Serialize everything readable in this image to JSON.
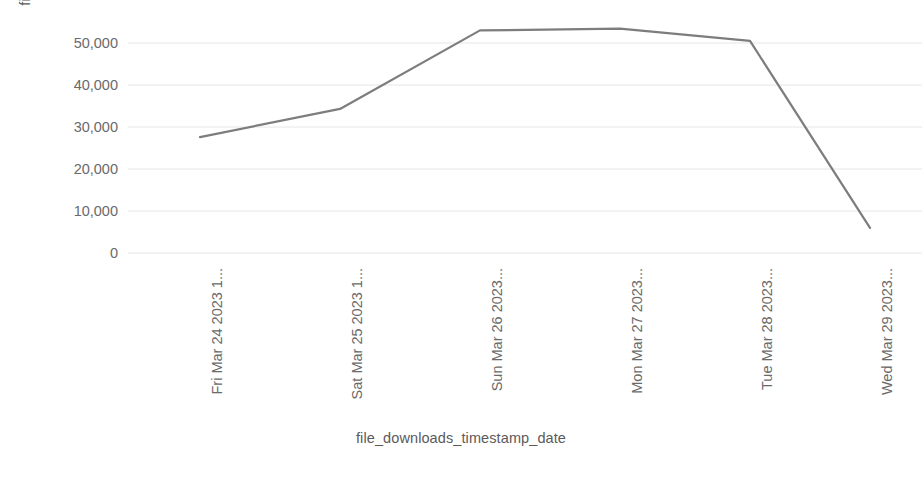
{
  "chart_data": {
    "type": "line",
    "title": "",
    "xlabel": "file_downloads_timestamp_date",
    "ylabel": "file_downloads_count",
    "categories": [
      "Fri Mar 24 2023 1...",
      "Sat Mar 25 2023 1...",
      "Sun Mar 26 2023...",
      "Mon Mar 27 2023...",
      "Tue Mar 28 2023...",
      "Wed Mar 29 2023..."
    ],
    "values": [
      27600,
      34300,
      53000,
      53400,
      50500,
      6000
    ],
    "series": [
      {
        "name": "file_downloads_count",
        "values": [
          27600,
          34300,
          53000,
          53400,
          50500,
          6000
        ],
        "color": "#7d7d7d"
      }
    ],
    "ylim": [
      0,
      55000
    ],
    "yticks": [
      0,
      10000,
      20000,
      30000,
      40000,
      50000
    ],
    "ytick_labels": [
      "0",
      "10,000",
      "20,000",
      "30,000",
      "40,000",
      "50,000"
    ],
    "grid": true,
    "grid_color": "#e6e6e6",
    "legend": false,
    "legend_position": "none",
    "line_color": "#7d7d7d",
    "line_width": 2.2,
    "markers": false,
    "background": "#ffffff",
    "text_color": "#6a6a6a"
  },
  "axes": {
    "y_title": "file_downloads_count",
    "x_title": "file_downloads_timestamp_date"
  }
}
